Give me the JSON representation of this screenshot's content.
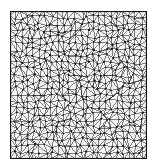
{
  "figure": {
    "kind": "triangular-finite-element-mesh",
    "title": "",
    "caption": "",
    "domain_shape": "square",
    "background_color": "#ffffff",
    "panel_color": "#f4f3f1",
    "ink_color": "#1a1a1a",
    "node_color": "#111111",
    "border_color": "#111111"
  },
  "chart_data": {
    "type": "diagram",
    "title": "",
    "xlabel": "",
    "ylabel": "",
    "grid": false,
    "legend": null,
    "mesh": {
      "element_type": "triangle",
      "domain": {
        "x0": 0,
        "y0": 0,
        "x1": 1,
        "y1": 1
      },
      "nodes_per_side": 24,
      "jitter": 0.34,
      "approx_node_count": 576,
      "approx_element_count": 1058,
      "boundary_closed": true
    }
  }
}
